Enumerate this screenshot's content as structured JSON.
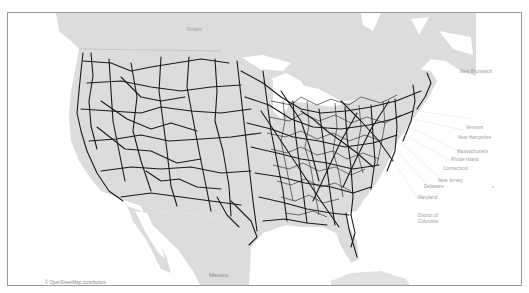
{
  "map": {
    "title": "US rail network map",
    "land_color": "#dcdcdc",
    "water_color": "#ffffff",
    "rail_color": "#1a1a1a",
    "border_color": "#9a9a9a",
    "labels": {
      "ontario": "Ontario",
      "quebec_hint": "",
      "new_brunswick": "New Brunswick",
      "vermont": "Vermont",
      "new_hampshire": "New Hampshire",
      "massachusetts": "Massachusetts",
      "rhode_island": "Rhode Island",
      "connecticut": "Connecticut",
      "new_jersey": "New Jersey",
      "delaware": "Delaware",
      "maryland": "Maryland",
      "district_of_columbia_1": "District of",
      "district_of_columbia_2": "Columbia",
      "mexico": "Mexico"
    },
    "attribution": "© OpenStreetMap contributors"
  }
}
